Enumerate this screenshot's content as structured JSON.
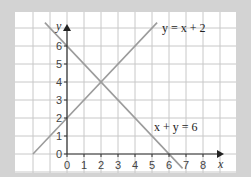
{
  "colors": {
    "page_background": "#d3d3d3",
    "panel_background": "#ffffff",
    "grid": "#c8c8c8",
    "axes": "#333333",
    "lines": "#9c9c9c",
    "text": "#333333"
  },
  "axes": {
    "x_letter": "x",
    "y_letter": "y"
  },
  "labels": {
    "line1": "y = x + 2",
    "line2": "x + y = 6"
  },
  "chart_data": {
    "type": "line",
    "title": "",
    "xlabel": "x",
    "ylabel": "y",
    "xlim": [
      -3,
      9.5
    ],
    "ylim": [
      -1,
      7.5
    ],
    "x_ticks": [
      0,
      1,
      2,
      3,
      4,
      5,
      6,
      7,
      8
    ],
    "y_ticks": [
      0,
      1,
      2,
      3,
      4,
      5,
      6
    ],
    "grid": true,
    "series": [
      {
        "name": "y = x + 2",
        "points": [
          [
            -2,
            0
          ],
          [
            5.3,
            7.3
          ]
        ],
        "label_position": [
          6.2,
          7.1
        ]
      },
      {
        "name": "x + y = 6",
        "points": [
          [
            -1.3,
            7.3
          ],
          [
            6.8,
            -0.8
          ]
        ],
        "label_position": [
          5.1,
          1.5
        ]
      }
    ],
    "intersection": [
      2,
      4
    ],
    "annotations": [
      "y = x + 2",
      "x + y = 6"
    ]
  }
}
